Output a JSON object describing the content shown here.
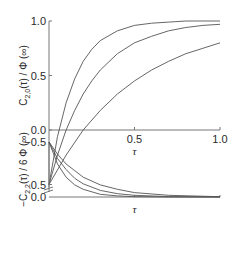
{
  "chart_data": [
    {
      "type": "line",
      "panel": "top",
      "ylabel": "C2,0(τ)/Φ(∞)",
      "ylabel_main": "C",
      "ylabel_sub": "2,0",
      "ylabel_rest": "(τ) / Φ (∞)",
      "xlabel": "τ",
      "xlim": [
        0,
        1.0
      ],
      "ylim": [
        -0.5,
        1.0
      ],
      "yticks": [
        1.0,
        0.5,
        0.0,
        -0.5
      ],
      "ytick_labels": [
        "1.0",
        "0.5",
        "0.0",
        "0.5"
      ],
      "xticks": [
        0.5,
        1.0
      ],
      "xtick_labels": [
        "0.5",
        "1.0"
      ],
      "grid": false,
      "series": [
        {
          "name": "curve-1",
          "x": [
            0,
            0.05,
            0.1,
            0.15,
            0.2,
            0.25,
            0.3,
            0.4,
            0.5,
            0.6,
            0.7,
            0.8,
            0.9,
            1.0
          ],
          "values": [
            -0.5,
            -0.06,
            0.25,
            0.47,
            0.63,
            0.74,
            0.82,
            0.91,
            0.96,
            0.98,
            0.99,
            1.0,
            1.0,
            1.0
          ]
        },
        {
          "name": "curve-2",
          "x": [
            0,
            0.05,
            0.1,
            0.15,
            0.2,
            0.25,
            0.3,
            0.4,
            0.5,
            0.6,
            0.7,
            0.8,
            0.9,
            1.0
          ],
          "values": [
            -0.5,
            -0.23,
            0.0,
            0.18,
            0.33,
            0.45,
            0.55,
            0.7,
            0.8,
            0.86,
            0.91,
            0.94,
            0.96,
            0.97
          ]
        },
        {
          "name": "curve-3",
          "x": [
            0,
            0.1,
            0.2,
            0.3,
            0.4,
            0.5,
            0.6,
            0.7,
            0.8,
            0.9,
            1.0
          ],
          "values": [
            -0.5,
            -0.23,
            0.0,
            0.18,
            0.33,
            0.45,
            0.55,
            0.63,
            0.7,
            0.75,
            0.8
          ]
        }
      ]
    },
    {
      "type": "line",
      "panel": "bottom",
      "ylabel": "−C2,2(τ)/6Φ(∞)",
      "ylabel_main": "−C",
      "ylabel_sub": "2,2",
      "ylabel_rest": "(τ) / 6 Φ (∞)",
      "xlabel": "τ",
      "xlim": [
        0,
        1.0
      ],
      "ylim": [
        -0.5,
        0.0
      ],
      "yticks": [
        0.0,
        -0.5
      ],
      "ytick_labels": [
        "0.0",
        "−0.5"
      ],
      "grid": false,
      "series": [
        {
          "name": "curve-1",
          "x": [
            0,
            0.05,
            0.1,
            0.15,
            0.2,
            0.3,
            0.4,
            0.5,
            0.7,
            1.0
          ],
          "values": [
            -0.5,
            -0.3,
            -0.18,
            -0.11,
            -0.07,
            -0.025,
            -0.01,
            -0.003,
            0.0,
            0.0
          ]
        },
        {
          "name": "curve-2",
          "x": [
            0,
            0.05,
            0.1,
            0.15,
            0.2,
            0.3,
            0.4,
            0.5,
            0.7,
            1.0
          ],
          "values": [
            -0.5,
            -0.35,
            -0.25,
            -0.17,
            -0.12,
            -0.06,
            -0.03,
            -0.015,
            -0.004,
            0.0
          ]
        },
        {
          "name": "curve-3",
          "x": [
            0,
            0.05,
            0.1,
            0.15,
            0.2,
            0.3,
            0.4,
            0.5,
            0.7,
            1.0
          ],
          "values": [
            -0.5,
            -0.39,
            -0.3,
            -0.24,
            -0.18,
            -0.11,
            -0.07,
            -0.04,
            -0.015,
            -0.003
          ]
        }
      ]
    }
  ]
}
